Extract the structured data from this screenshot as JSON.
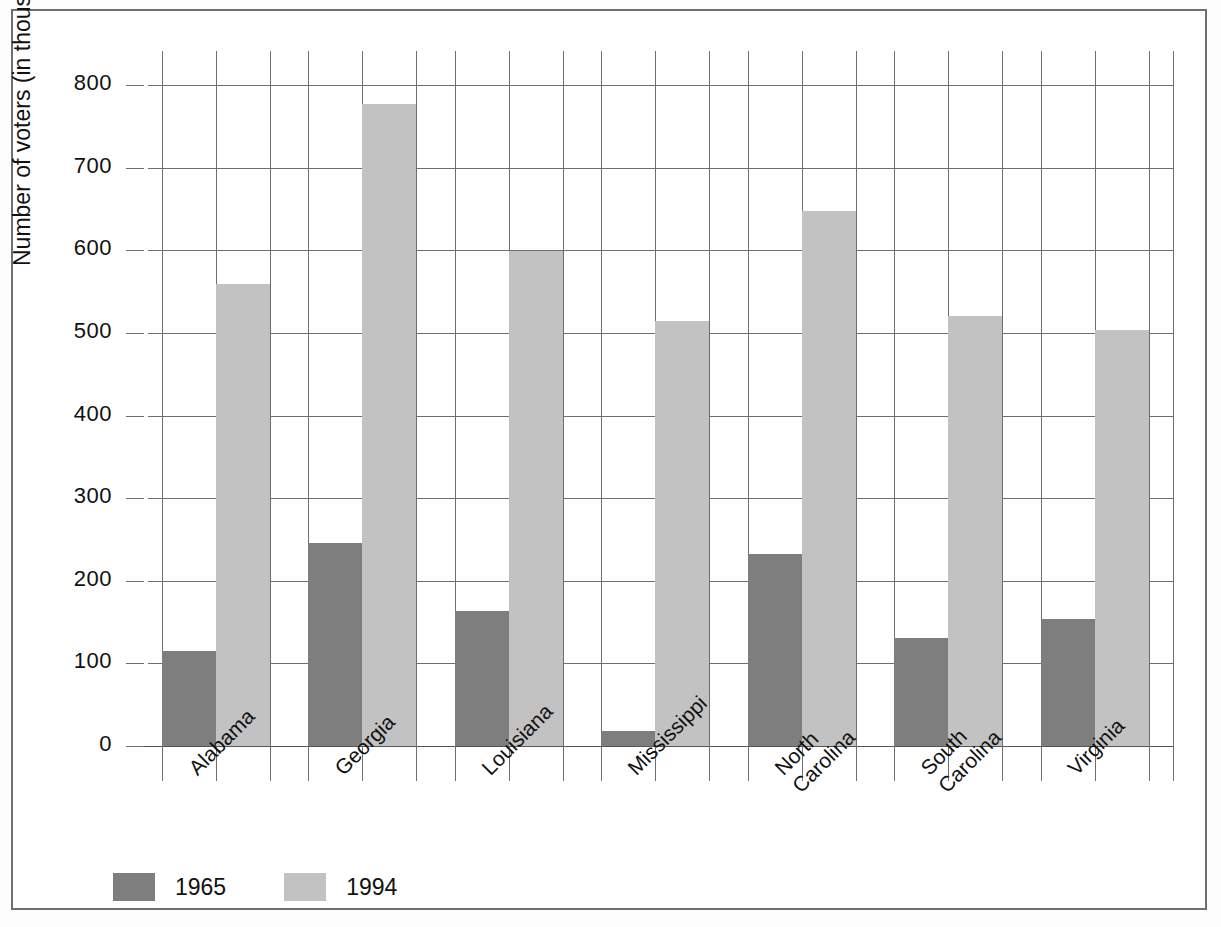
{
  "chart_data": {
    "type": "bar",
    "title": "",
    "xlabel": "",
    "ylabel": "Number of voters (in thousands)",
    "ylim": [
      0,
      830
    ],
    "ytick_labels": [
      "0",
      "100",
      "200",
      "300",
      "400",
      "500",
      "600",
      "700",
      "800"
    ],
    "yticks": [
      0,
      100,
      200,
      300,
      400,
      500,
      600,
      700,
      800
    ],
    "grid": true,
    "legend_position": "bottom-left",
    "categories": [
      "Alabama",
      "Georgia",
      "Louisiana",
      "Mississippi",
      "North Carolina",
      "South Carolina",
      "Virginia"
    ],
    "category_lines": [
      [
        "Alabama"
      ],
      [
        "Georgia"
      ],
      [
        "Louisiana"
      ],
      [
        "Mississippi"
      ],
      [
        "North",
        "Carolina"
      ],
      [
        "South",
        "Carolina"
      ],
      [
        "Virginia"
      ]
    ],
    "series": [
      {
        "name": "1965",
        "color": "#7e7e7e",
        "values": [
          115,
          246,
          163,
          18,
          232,
          131,
          154
        ]
      },
      {
        "name": "1994",
        "color": "#c2c2c2",
        "values": [
          559,
          777,
          599,
          514,
          648,
          520,
          503
        ]
      }
    ]
  },
  "legend": {
    "items": [
      {
        "label": "1965",
        "color": "#7e7e7e"
      },
      {
        "label": "1994",
        "color": "#c2c2c2"
      }
    ]
  },
  "axis": {
    "y_title": "Number of voters (in thousands)"
  }
}
